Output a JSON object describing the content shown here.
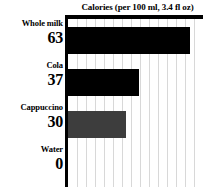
{
  "chart_data": {
    "type": "bar",
    "orientation": "horizontal",
    "title": "Calories (per 100 ml, 3.4 fl oz)",
    "xlabel": "",
    "ylabel": "",
    "categories": [
      "Whole milk",
      "Cola",
      "Cappuccino",
      "Water"
    ],
    "values": [
      63,
      37,
      30,
      0
    ],
    "value_labels": [
      "63",
      "37",
      "30",
      "0"
    ],
    "series": [
      {
        "name": "Calories per 100 ml",
        "values": [
          63,
          37,
          30,
          0
        ]
      }
    ],
    "bar_colors": [
      "#000000",
      "#000000",
      "#3d3d3d",
      "#000000"
    ],
    "xlim": [
      0,
      70
    ],
    "grid": true,
    "grid_axis": "x",
    "gridline_count": 14,
    "gridline_color": "#d8d8d8",
    "legend": false,
    "axis_color": "#000000",
    "background": "#ffffff",
    "text_color": "#000000"
  }
}
